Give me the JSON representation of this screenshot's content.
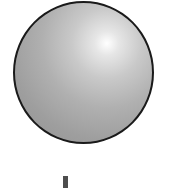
{
  "scene": {
    "sphere": {
      "shape": "circle",
      "fill": "gray-gradient",
      "highlight_color": "#ffffff",
      "base_color": "#9e9e9e",
      "outline_color": "#1a1a1a"
    },
    "marker": {
      "shape": "vertical-bar",
      "color": "#4d4d4d"
    }
  }
}
